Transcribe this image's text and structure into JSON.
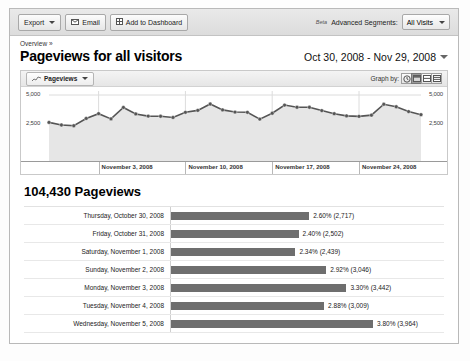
{
  "toolbar": {
    "export_label": "Export",
    "export_icon": "chevron-down-icon",
    "email_label": "Email",
    "email_icon": "envelope-icon",
    "dashboard_label": "Add to Dashboard",
    "dashboard_icon": "grid-icon",
    "beta_label": "Beta",
    "segments_label": "Advanced Segments:",
    "segment_value": "All Visits",
    "segment_icon": "chevron-down-icon"
  },
  "header": {
    "breadcrumb": "Overview »",
    "title": "Pageviews for all visitors",
    "date_range": "Oct 30, 2008 - Nov 29, 2008",
    "date_icon": "chevron-down-icon"
  },
  "chart_header": {
    "metric_tab": "Pageviews",
    "metric_icon": "sparkline-icon",
    "metric_caret": "chevron-down-icon",
    "graph_by_label": "Graph by:",
    "graph_by_options": [
      {
        "name": "hourly",
        "icon": "clock-icon",
        "active": false
      },
      {
        "name": "daily",
        "icon": "day-icon",
        "active": true
      },
      {
        "name": "weekly",
        "icon": "week-icon",
        "active": false
      },
      {
        "name": "monthly",
        "icon": "month-icon",
        "active": false
      }
    ]
  },
  "totals": "104,430 Pageviews",
  "chart_data": {
    "type": "line",
    "title": "Pageviews for all visitors",
    "xlabel": "",
    "ylabel": "Pageviews",
    "ylim": [
      0,
      5000
    ],
    "grid": true,
    "legend": "none",
    "y_ticks": [
      "2,500",
      "5,000"
    ],
    "y_tick_values": [
      2500,
      5000
    ],
    "y_axis_left_labels": [
      "5,000",
      "2,500"
    ],
    "y_axis_right_labels": [
      "5,000",
      "2,500"
    ],
    "x_tick_labels": [
      "November 3, 2008",
      "November 10, 2008",
      "November 17, 2008",
      "November 24, 2008"
    ],
    "x_tick_positions": [
      4,
      11,
      18,
      25
    ],
    "x": [
      "Oct 30, 2008",
      "Oct 31, 2008",
      "Nov 1, 2008",
      "Nov 2, 2008",
      "Nov 3, 2008",
      "Nov 4, 2008",
      "Nov 5, 2008",
      "Nov 6, 2008",
      "Nov 7, 2008",
      "Nov 8, 2008",
      "Nov 9, 2008",
      "Nov 10, 2008",
      "Nov 11, 2008",
      "Nov 12, 2008",
      "Nov 13, 2008",
      "Nov 14, 2008",
      "Nov 15, 2008",
      "Nov 16, 2008",
      "Nov 17, 2008",
      "Nov 18, 2008",
      "Nov 19, 2008",
      "Nov 20, 2008",
      "Nov 21, 2008",
      "Nov 22, 2008",
      "Nov 23, 2008",
      "Nov 24, 2008",
      "Nov 25, 2008",
      "Nov 26, 2008",
      "Nov 27, 2008",
      "Nov 28, 2008",
      "Nov 29, 2008"
    ],
    "values": [
      2717,
      2502,
      2439,
      3046,
      3442,
      3009,
      3964,
      3420,
      3240,
      3230,
      3130,
      3560,
      3720,
      4250,
      3760,
      3580,
      3560,
      2990,
      3480,
      4160,
      3980,
      3980,
      3700,
      3440,
      3260,
      3220,
      3320,
      4230,
      4020,
      3620,
      3360
    ]
  },
  "bar_table": {
    "rows": [
      {
        "label": "Thursday, October 30, 2008",
        "percent": "2.60%",
        "count": "(2,717)",
        "value": "2.60% (2,717)",
        "pct_num": 2.6
      },
      {
        "label": "Friday, October 31, 2008",
        "percent": "2.40%",
        "count": "(2,502)",
        "value": "2.40% (2,502)",
        "pct_num": 2.4
      },
      {
        "label": "Saturday, November 1, 2008",
        "percent": "2.34%",
        "count": "(2,439)",
        "value": "2.34% (2,439)",
        "pct_num": 2.34
      },
      {
        "label": "Sunday, November 2, 2008",
        "percent": "2.92%",
        "count": "(3,046)",
        "value": "2.92% (3,046)",
        "pct_num": 2.92
      },
      {
        "label": "Monday, November 3, 2008",
        "percent": "3.30%",
        "count": "(3,442)",
        "value": "3.30% (3,442)",
        "pct_num": 3.3
      },
      {
        "label": "Tuesday, November 4, 2008",
        "percent": "2.88%",
        "count": "(3,009)",
        "value": "2.88% (3,009)",
        "pct_num": 2.88
      },
      {
        "label": "Wednesday, November 5, 2008",
        "percent": "3.80%",
        "count": "(3,964)",
        "value": "3.80% (3,964)",
        "pct_num": 3.8
      }
    ]
  },
  "colors": {
    "bar_fill": "#6e6e6e",
    "line": "#555555",
    "area": "#e6e6e6",
    "panel_border": "#c9c9c9"
  }
}
